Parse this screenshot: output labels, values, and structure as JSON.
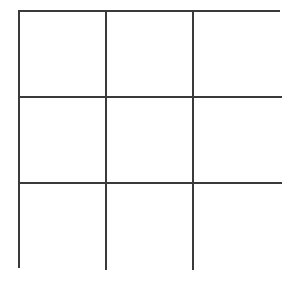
{
  "grid": {
    "rows": 3,
    "columns": 3,
    "line_color": "#3a3a3a",
    "background": "#ffffff",
    "cells": [
      [
        "",
        "",
        ""
      ],
      [
        "",
        "",
        ""
      ],
      [
        "",
        "",
        ""
      ]
    ]
  }
}
